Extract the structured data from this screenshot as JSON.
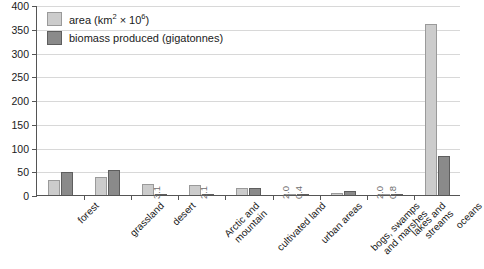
{
  "chart_data": {
    "type": "bar",
    "title": "",
    "xlabel": "",
    "ylabel": "",
    "ylim": [
      0,
      400
    ],
    "ytick_step": 50,
    "yticks": [
      "400",
      "350",
      "300",
      "250",
      "200",
      "150",
      "100",
      "50",
      "0"
    ],
    "grid": true,
    "legend_position": "top-left",
    "categories": [
      "forest",
      "grassland",
      "desert",
      "Arctic and\nmountain",
      "cultivated land",
      "urban areas",
      "bogs, swamps\nand marshes",
      "lakes and\nstreams",
      "oceans"
    ],
    "series": [
      {
        "name": "area (km² × 10⁶)",
        "color": "#cccccc",
        "values": [
          31,
          37,
          24,
          21,
          14,
          2.0,
          3.5,
          2.0,
          361
        ]
      },
      {
        "name": "biomass produced (gigatonnes)",
        "color": "#8a8a8a",
        "values": [
          48,
          53,
          3.1,
          2.1,
          14,
          0.4,
          8,
          0.8,
          83
        ]
      }
    ],
    "point_labels": {
      "desert": {
        "biomass": "3.1"
      },
      "Arctic and\nmountain": {
        "biomass": "2.1"
      },
      "urban areas": {
        "area": "2.0",
        "biomass": "0.4"
      },
      "lakes and\nstreams": {
        "area": "2.0",
        "biomass": "0.8"
      }
    }
  },
  "legend": {
    "items": [
      {
        "label_prefix": "area (km",
        "label_sup1": "2",
        "label_mid": " × 10",
        "label_sup2": "6",
        "label_suffix": ")"
      },
      {
        "label": "biomass produced (gigatonnes)"
      }
    ]
  }
}
